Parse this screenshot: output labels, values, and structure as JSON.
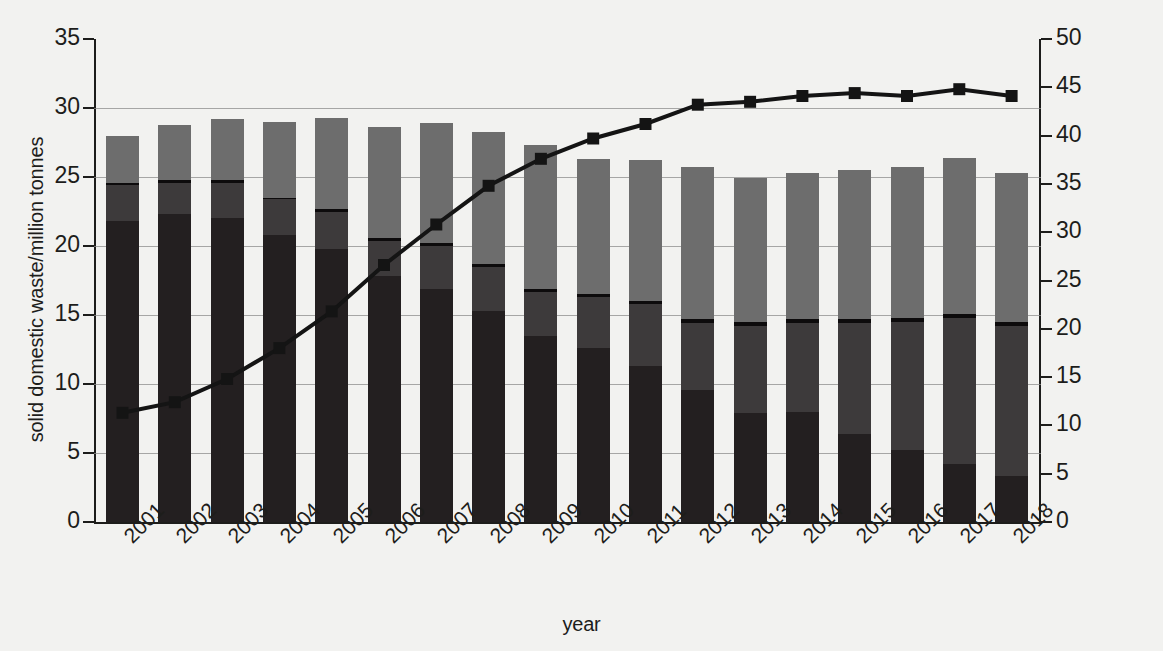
{
  "chart_data": {
    "type": "bar",
    "title": "",
    "subtitle": "",
    "xlabel": "year",
    "ylabel": "solid domestic waste/million tonnes",
    "ylabel_secondary": "recycling rate/%",
    "ylim": [
      0,
      35
    ],
    "ylim_secondary": [
      0,
      50
    ],
    "yticks": [
      0,
      5,
      10,
      15,
      20,
      25,
      30,
      35
    ],
    "yticks_secondary": [
      0,
      5,
      10,
      15,
      20,
      25,
      30,
      35,
      40,
      45,
      50
    ],
    "grid": true,
    "legend_position": "none",
    "stacked": true,
    "categories": [
      "2001",
      "2002",
      "2003",
      "2004",
      "2005",
      "2006",
      "2007",
      "2008",
      "2009",
      "2010",
      "2011",
      "2012",
      "2013",
      "2014",
      "2015",
      "2016",
      "2017",
      "2018"
    ],
    "series": [
      {
        "name": "landfill",
        "axis": "left",
        "color": "#231f20",
        "values": [
          21.8,
          22.3,
          22.0,
          20.8,
          19.8,
          17.8,
          16.9,
          15.3,
          13.5,
          12.6,
          11.3,
          9.6,
          7.9,
          8.0,
          6.4,
          5.2,
          4.2,
          3.3
        ]
      },
      {
        "name": "incineration",
        "axis": "left",
        "color": "#3d3a3b",
        "values": [
          2.6,
          2.3,
          2.6,
          2.6,
          2.7,
          2.6,
          3.1,
          3.2,
          3.2,
          3.7,
          4.5,
          4.8,
          6.3,
          6.4,
          8.0,
          9.3,
          10.6,
          10.9
        ]
      },
      {
        "name": "other",
        "axis": "left",
        "color": "#0d0b0c",
        "values": [
          0.2,
          0.2,
          0.2,
          0.1,
          0.2,
          0.2,
          0.2,
          0.2,
          0.2,
          0.2,
          0.2,
          0.3,
          0.3,
          0.3,
          0.3,
          0.3,
          0.3,
          0.3
        ]
      },
      {
        "name": "recycling",
        "axis": "left",
        "color": "#6d6d6d",
        "values": [
          3.4,
          4.0,
          4.4,
          5.5,
          6.6,
          8.0,
          8.7,
          9.6,
          10.4,
          9.8,
          10.2,
          11.0,
          10.4,
          10.6,
          10.8,
          10.9,
          11.3,
          10.8
        ]
      }
    ],
    "line_series": {
      "name": "recycling rate",
      "axis": "right",
      "color": "#141414",
      "marker": "square",
      "values": [
        11.3,
        12.4,
        14.8,
        18.0,
        21.8,
        26.6,
        30.8,
        34.8,
        37.6,
        39.7,
        41.2,
        43.2,
        43.5,
        44.1,
        44.4,
        44.1,
        44.8,
        44.1
      ]
    }
  },
  "axes": {
    "left_title": "solid domestic waste/million tonnes",
    "right_title": "recycling rate/%",
    "x_title": "year"
  }
}
